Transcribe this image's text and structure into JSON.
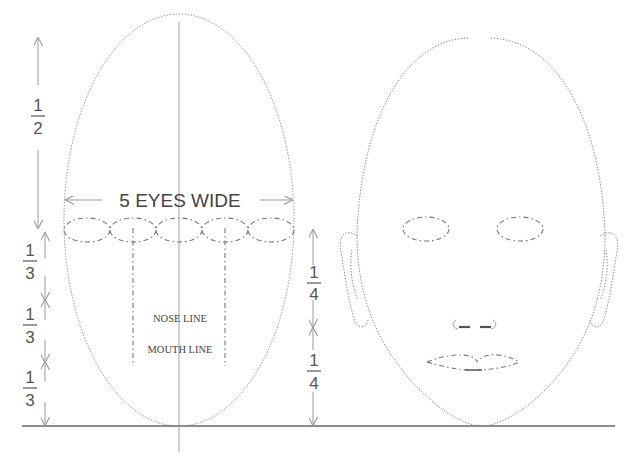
{
  "diagram": {
    "left_figure": {
      "label": "proportion-guide",
      "eyes_label": "5 EYES WIDE",
      "eye_count": 5,
      "nose_label": "NOSE LINE",
      "mouth_label": "MOUTH LINE"
    },
    "left_scale": {
      "top": {
        "num": "1",
        "den": "2"
      },
      "thirds": [
        {
          "num": "1",
          "den": "3"
        },
        {
          "num": "1",
          "den": "3"
        },
        {
          "num": "1",
          "den": "3"
        }
      ]
    },
    "middle_scale": {
      "quarters": [
        {
          "num": "1",
          "den": "4"
        },
        {
          "num": "1",
          "den": "4"
        }
      ]
    },
    "right_figure": {
      "label": "finished-face",
      "features": [
        "eyes",
        "ears",
        "nose",
        "mouth"
      ]
    },
    "colors": {
      "line": "#8a8a8a",
      "text": "#444444",
      "baseline": "#666666",
      "background": "#ffffff"
    }
  }
}
